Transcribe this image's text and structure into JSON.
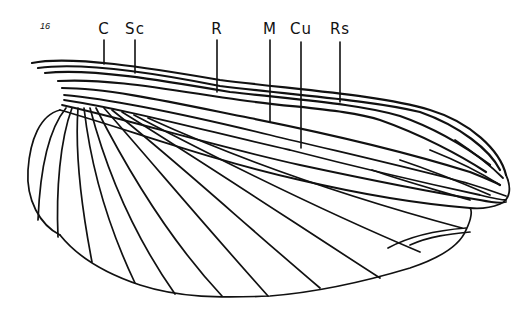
{
  "figure": {
    "number": "16",
    "ink_color": "#111111",
    "background": "#ffffff"
  },
  "labels": [
    {
      "text": "C",
      "x": 104,
      "y": 20,
      "leader": {
        "x": 104,
        "y1": 40,
        "y2": 64
      }
    },
    {
      "text": "Sc",
      "x": 135,
      "y": 20,
      "leader": {
        "x": 135,
        "y1": 40,
        "y2": 73
      }
    },
    {
      "text": "R",
      "x": 217,
      "y": 20,
      "leader": {
        "x": 217,
        "y1": 40,
        "y2": 92
      }
    },
    {
      "text": "M",
      "x": 270,
      "y": 20,
      "leader": {
        "x": 270,
        "y1": 40,
        "y2": 122
      }
    },
    {
      "text": "Cu",
      "x": 301,
      "y": 20,
      "leader": {
        "x": 301,
        "y1": 42,
        "y2": 148
      }
    },
    {
      "text": "Rs",
      "x": 340,
      "y": 20,
      "leader": {
        "x": 340,
        "y1": 42,
        "y2": 102
      }
    }
  ]
}
